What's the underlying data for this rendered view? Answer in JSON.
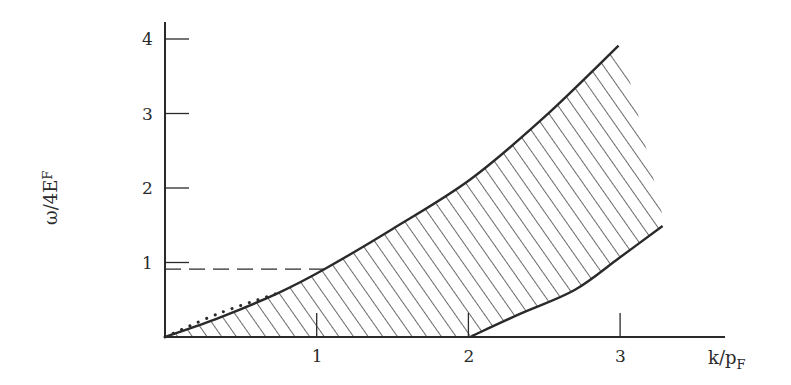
{
  "chart_data": {
    "type": "area",
    "title": "",
    "xlabel": "k/p_F",
    "xlabel_main": "k/p",
    "xlabel_sub": "F",
    "ylabel": "ω/4E_F",
    "ylabel_main": "ω/4E",
    "ylabel_sub": "F",
    "xlim": [
      0,
      3.6
    ],
    "ylim": [
      0,
      4.2
    ],
    "x_ticks": [
      1,
      2,
      3
    ],
    "x_tick_labels": [
      "1",
      "2",
      "3"
    ],
    "y_ticks": [
      1,
      2,
      3,
      4
    ],
    "y_tick_labels": [
      "1",
      "2",
      "3",
      "4"
    ],
    "grid": false,
    "legend": null,
    "series": [
      {
        "name": "upper boundary",
        "style": "solid",
        "x": [
          0,
          0.36,
          0.745,
          1.05,
          1.5,
          2.01,
          2.5,
          2.99
        ],
        "y": [
          0,
          0.26,
          0.59,
          0.91,
          1.45,
          2.11,
          2.95,
          3.91
        ]
      },
      {
        "name": "lower boundary",
        "style": "solid",
        "x": [
          2.02,
          2.34,
          2.7,
          3.0,
          3.28
        ],
        "y": [
          0.01,
          0.31,
          0.63,
          1.07,
          1.49
        ]
      },
      {
        "name": "dotted curve",
        "style": "dotted",
        "x": [
          0,
          0.36,
          0.745
        ],
        "y": [
          0,
          0.32,
          0.59
        ]
      }
    ],
    "shaded_region": {
      "description": "hatched region between upper boundary and lower boundary / k-axis",
      "hatch": "diagonal"
    },
    "annotations": [
      {
        "type": "dashed-horizontal-line",
        "y": 0.91,
        "x_from": 0,
        "x_to": 1.05
      }
    ]
  }
}
